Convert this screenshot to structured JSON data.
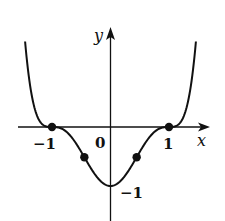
{
  "figure": {
    "function_description": "f(x) = (x^2 - 1)^3",
    "axes": {
      "x_label": "x",
      "y_label": "y",
      "origin_label": "0",
      "x_tick_labels": [
        "-1",
        "1"
      ],
      "y_tick_labels": [
        "-1"
      ]
    },
    "labels": {
      "x_axis": "x",
      "y_axis": "y",
      "origin": "0",
      "x_neg_one": "−1",
      "x_pos_one": "1",
      "y_neg_one": "−1"
    },
    "marked_points": [
      {
        "name": "root-left",
        "x": -1,
        "y": 0
      },
      {
        "name": "inflection-left",
        "x": -0.447,
        "y": -0.512
      },
      {
        "name": "inflection-right",
        "x": 0.447,
        "y": -0.512
      },
      {
        "name": "root-right",
        "x": 1,
        "y": 0
      }
    ],
    "minimum": {
      "x": 0,
      "y": -1
    },
    "colors": {
      "stroke": "#111111",
      "background": "#ffffff"
    }
  },
  "chart_data": {
    "type": "line",
    "title": "",
    "xlabel": "x",
    "ylabel": "y",
    "xlim": [
      -1.5,
      1.6
    ],
    "ylim": [
      -1.6,
      1.7
    ],
    "grid": false,
    "legend": null,
    "series": [
      {
        "name": "f(x) = (x^2-1)^3",
        "x": [
          -1.46,
          -1.4,
          -1.3,
          -1.2,
          -1.1,
          -1.0,
          -0.9,
          -0.8,
          -0.7,
          -0.6,
          -0.5,
          -0.447,
          -0.4,
          -0.3,
          -0.2,
          -0.1,
          0.0,
          0.1,
          0.2,
          0.3,
          0.4,
          0.447,
          0.5,
          0.6,
          0.7,
          0.8,
          0.9,
          1.0,
          1.1,
          1.2,
          1.3,
          1.4,
          1.46
        ],
        "y": [
          1.49,
          0.92,
          0.43,
          0.1,
          0.01,
          0.0,
          -0.01,
          -0.05,
          -0.13,
          -0.26,
          -0.42,
          -0.51,
          -0.59,
          -0.75,
          -0.88,
          -0.97,
          -1.0,
          -0.97,
          -0.88,
          -0.75,
          -0.59,
          -0.51,
          -0.42,
          -0.26,
          -0.13,
          -0.05,
          -0.01,
          0.0,
          0.01,
          0.1,
          0.43,
          0.92,
          1.49
        ]
      }
    ],
    "annotations": [
      {
        "text": "-1",
        "at": [
          -1,
          0
        ],
        "position": "below"
      },
      {
        "text": "1",
        "at": [
          1,
          0
        ],
        "position": "below"
      },
      {
        "text": "0",
        "at": [
          0,
          0
        ],
        "position": "below-left"
      },
      {
        "text": "-1",
        "at": [
          0,
          -1
        ],
        "position": "right"
      }
    ],
    "marked_points": [
      [
        -1,
        0
      ],
      [
        -0.447,
        -0.512
      ],
      [
        0.447,
        -0.512
      ],
      [
        1,
        0
      ]
    ]
  }
}
